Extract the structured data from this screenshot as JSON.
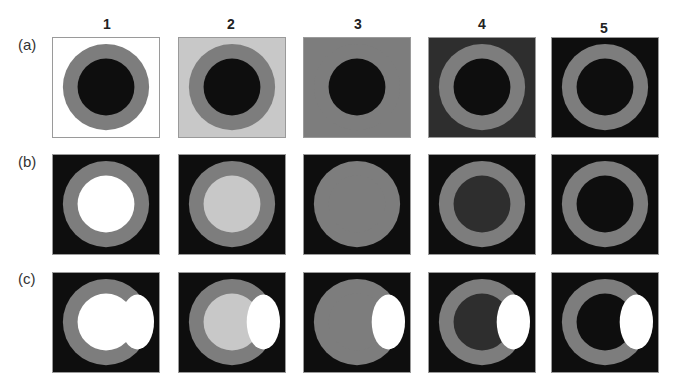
{
  "columns": [
    "1",
    "2",
    "3",
    "4",
    "5"
  ],
  "rows": [
    "(a)",
    "(b)",
    "(c)"
  ],
  "colors": {
    "white": "#ffffff",
    "light_gray": "#c8c8c8",
    "mid_gray": "#7d7d7d",
    "dark_gray": "#2e2e2e",
    "black": "#0e0e0e",
    "ring": "#7d7d7d"
  },
  "panels": {
    "a": [
      {
        "bg": "#ffffff",
        "ring": "#7d7d7d",
        "center": "#0e0e0e",
        "highlight": false
      },
      {
        "bg": "#c8c8c8",
        "ring": "#7d7d7d",
        "center": "#0e0e0e",
        "highlight": false
      },
      {
        "bg": "#7d7d7d",
        "ring": "#7d7d7d",
        "center": "#0e0e0e",
        "highlight": false
      },
      {
        "bg": "#2e2e2e",
        "ring": "#7d7d7d",
        "center": "#0e0e0e",
        "highlight": false
      },
      {
        "bg": "#0e0e0e",
        "ring": "#7d7d7d",
        "center": "#0e0e0e",
        "highlight": false
      }
    ],
    "b": [
      {
        "bg": "#0e0e0e",
        "ring": "#7d7d7d",
        "center": "#ffffff",
        "highlight": false
      },
      {
        "bg": "#0e0e0e",
        "ring": "#7d7d7d",
        "center": "#c8c8c8",
        "highlight": false
      },
      {
        "bg": "#0e0e0e",
        "ring": "#7d7d7d",
        "center": "#7d7d7d",
        "highlight": false
      },
      {
        "bg": "#0e0e0e",
        "ring": "#7d7d7d",
        "center": "#2e2e2e",
        "highlight": false
      },
      {
        "bg": "#0e0e0e",
        "ring": "#7d7d7d",
        "center": "#0e0e0e",
        "highlight": false
      }
    ],
    "c": [
      {
        "bg": "#0e0e0e",
        "ring": "#7d7d7d",
        "center": "#ffffff",
        "highlight": true
      },
      {
        "bg": "#0e0e0e",
        "ring": "#7d7d7d",
        "center": "#c8c8c8",
        "highlight": true
      },
      {
        "bg": "#0e0e0e",
        "ring": "#7d7d7d",
        "center": "#7d7d7d",
        "highlight": true
      },
      {
        "bg": "#0e0e0e",
        "ring": "#7d7d7d",
        "center": "#2e2e2e",
        "highlight": true
      },
      {
        "bg": "#0e0e0e",
        "ring": "#7d7d7d",
        "center": "#0e0e0e",
        "highlight": true
      }
    ]
  }
}
